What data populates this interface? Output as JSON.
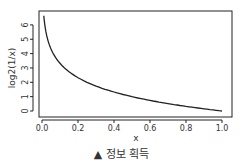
{
  "chart_data": {
    "type": "line",
    "title": "",
    "xlabel": "x",
    "ylabel": "log2(1/x)",
    "xlim": [
      0.0,
      1.0
    ],
    "ylim": [
      0,
      6.6
    ],
    "x_ticks": [
      "0.0",
      "0.2",
      "0.4",
      "0.6",
      "0.8",
      "1.0"
    ],
    "y_ticks": [
      "0",
      "1",
      "2",
      "3",
      "4",
      "5",
      "6"
    ],
    "grid": false,
    "legend": null,
    "series": [
      {
        "name": "log2(1/x)",
        "color": "#222222",
        "x": [
          0.01,
          0.02,
          0.03,
          0.04,
          0.05,
          0.07,
          0.1,
          0.15,
          0.2,
          0.3,
          0.4,
          0.5,
          0.6,
          0.7,
          0.8,
          0.9,
          1.0
        ],
        "y": [
          6.64,
          5.64,
          5.06,
          4.64,
          4.32,
          3.84,
          3.32,
          2.74,
          2.32,
          1.74,
          1.32,
          1.0,
          0.74,
          0.51,
          0.32,
          0.15,
          0.0
        ]
      }
    ]
  },
  "caption": "▲ 정보 획득"
}
